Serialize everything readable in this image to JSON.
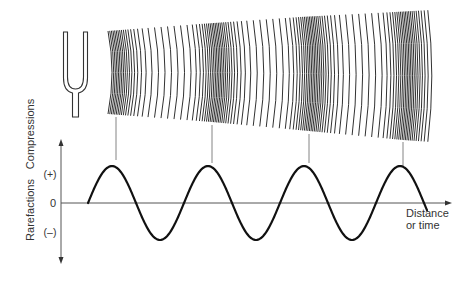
{
  "figure": {
    "colors": {
      "ink": "#1a1a1a",
      "axis": "#555555",
      "connector": "#777777",
      "background": "#ffffff"
    },
    "source": {
      "icon": "tuning-fork-icon"
    },
    "wavefronts": {
      "x_start": 108,
      "x_end": 431,
      "top_edge": [
        [
          108,
          31
        ],
        [
          200,
          24
        ],
        [
          300,
          17
        ],
        [
          395,
          12
        ],
        [
          431,
          10
        ]
      ],
      "bottom_edge": [
        [
          108,
          114
        ],
        [
          212,
          122
        ],
        [
          309,
          131
        ],
        [
          403,
          140
        ],
        [
          431,
          142
        ]
      ],
      "bulge": 4,
      "compression_centers_x": [
        113,
        214,
        309,
        404
      ],
      "band_half_width": 12,
      "dense_spacing": 1.6,
      "sparse_spacing": 6.5
    },
    "connectors": [
      {
        "x": 116,
        "y1": 117,
        "y2": 160
      },
      {
        "x": 212,
        "y1": 125,
        "y2": 163
      },
      {
        "x": 309,
        "y1": 134,
        "y2": 163
      },
      {
        "x": 403,
        "y1": 142,
        "y2": 166
      }
    ],
    "graph": {
      "y_axis": {
        "x": 61,
        "top": 140,
        "bottom": 263
      },
      "x_axis": {
        "y": 203,
        "left": 61,
        "right": 451
      },
      "wave": {
        "x_start": 88,
        "x_end": 427,
        "period": 96,
        "amplitude": 37,
        "peaks_x": [
          116,
          212,
          309,
          404
        ]
      },
      "labels": {
        "compressions": "Compressions",
        "rarefactions": "Rarefactions",
        "plus": "(+)",
        "zero": "0",
        "minus": "(–)",
        "x_axis_line1": "Distance",
        "x_axis_line2": "or time"
      }
    }
  }
}
